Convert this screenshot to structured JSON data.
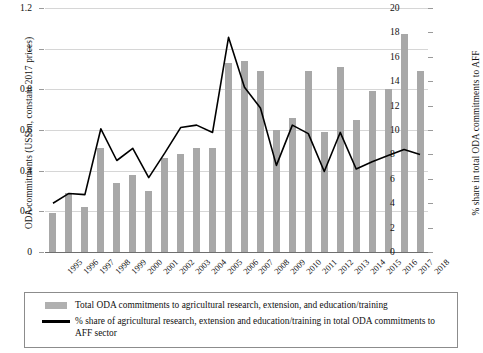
{
  "chart_data": {
    "type": "bar",
    "title": "",
    "subtitle": "",
    "xlabel": "",
    "ylabel": "ODA commitments (US$bn, constant 2017 prices)",
    "y2label": "% share in total ODA commitments to AFF",
    "ylim": [
      0,
      1.2
    ],
    "y2lim": [
      0,
      20
    ],
    "grid": true,
    "legend_position": "bottom",
    "categories": [
      "1995",
      "1996",
      "1997",
      "1998",
      "1999",
      "2000",
      "2001",
      "2002",
      "2003",
      "2004",
      "2005",
      "2006",
      "2007",
      "2008",
      "2009",
      "2010",
      "2011",
      "2012",
      "2013",
      "2014",
      "2015",
      "2016",
      "2017",
      "2018"
    ],
    "yticks": [
      "0",
      "0.2",
      "0.4",
      "0.6",
      "0.8",
      "1",
      "1.2"
    ],
    "ytick_values": [
      0,
      0.2,
      0.4,
      0.6,
      0.8,
      1,
      1.2
    ],
    "y2ticks": [
      "0",
      "2",
      "4",
      "6",
      "8",
      "10",
      "12",
      "14",
      "16",
      "18",
      "20"
    ],
    "y2tick_values": [
      0,
      2,
      4,
      6,
      8,
      10,
      12,
      14,
      16,
      18,
      20
    ],
    "series": [
      {
        "name": "Total ODA commitments to agricultural research, extension, and education/training",
        "type": "bar",
        "axis": "left",
        "color": "#a8a8a8",
        "values": [
          0.19,
          0.29,
          0.22,
          0.51,
          0.34,
          0.38,
          0.3,
          0.46,
          0.48,
          0.51,
          0.51,
          0.93,
          0.94,
          0.89,
          0.6,
          0.66,
          0.89,
          0.59,
          0.91,
          0.65,
          0.79,
          0.8,
          1.07,
          0.89
        ]
      },
      {
        "name": "% share of agricultural research, extension and education/training in total ODA commitments to AFF sector",
        "type": "line",
        "axis": "right",
        "color": "#000000",
        "values": [
          4.0,
          4.8,
          4.7,
          10.1,
          7.5,
          8.5,
          6.1,
          8.1,
          10.2,
          10.4,
          9.8,
          17.6,
          13.5,
          11.8,
          7.1,
          10.4,
          9.7,
          6.6,
          9.8,
          6.8,
          7.4,
          7.9,
          8.4,
          8.0
        ]
      }
    ]
  },
  "legend": {
    "entries": [
      {
        "label": "Total ODA commitments to agricultural research, extension, and education/training",
        "marker": "bar-swatch"
      },
      {
        "label": "% share of agricultural research, extension and education/training in total ODA commitments to AFF sector",
        "marker": "line-swatch"
      }
    ]
  }
}
